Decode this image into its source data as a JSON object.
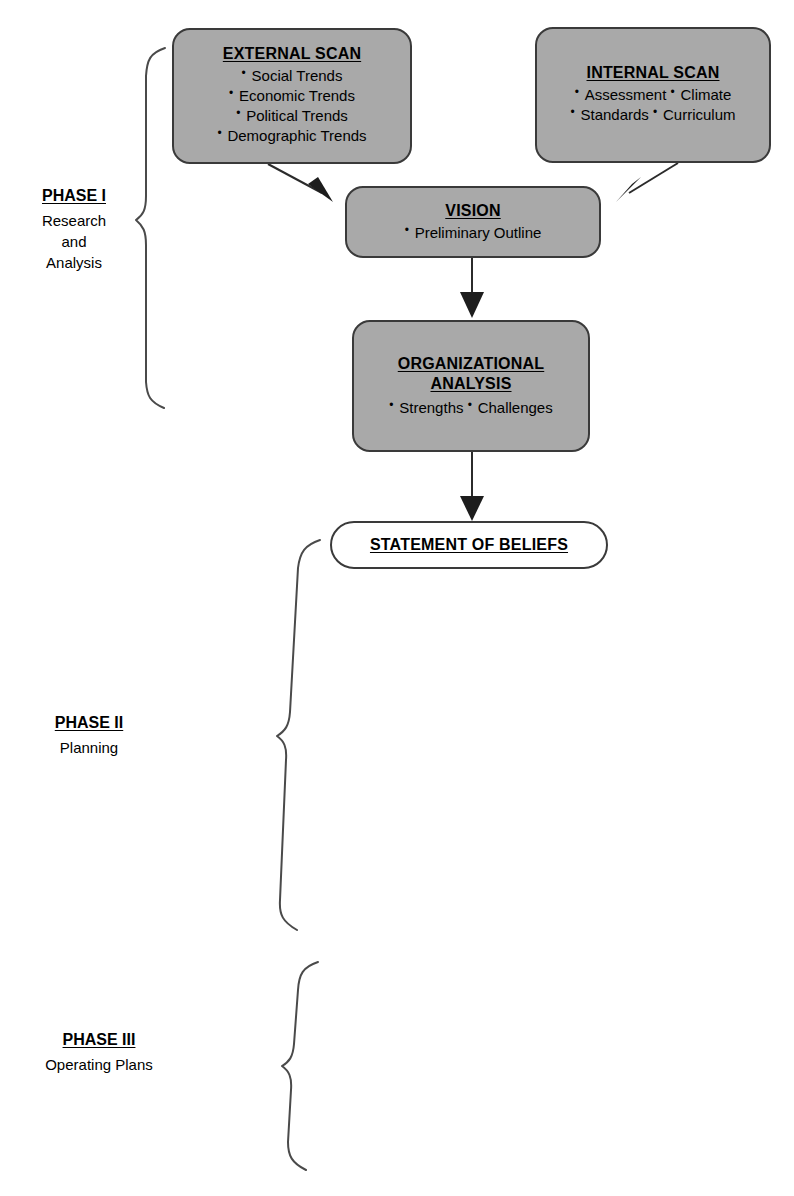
{
  "diagram": {
    "colors": {
      "box_fill_gray": "#a9a9a9",
      "box_fill_white": "#ffffff",
      "stroke": "#3a3a3a",
      "text": "#000000"
    },
    "nodes": {
      "external_scan": {
        "title": "EXTERNAL SCAN",
        "items": [
          "Social Trends",
          "Economic Trends",
          "Political Trends",
          "Demographic Trends"
        ]
      },
      "internal_scan": {
        "title": "INTERNAL  SCAN",
        "items": [
          "Assessment",
          "Climate",
          "Standards",
          "Curriculum"
        ]
      },
      "vision": {
        "title": "VISION",
        "items": [
          "Preliminary Outline"
        ]
      },
      "organizational_analysis": {
        "title": "ORGANIZATIONAL\nANALYSIS",
        "items": [
          "Strengths",
          "Challenges"
        ]
      },
      "statement_of_beliefs": {
        "title": "STATEMENT OF BELIEFS",
        "items": []
      }
    },
    "phases": [
      {
        "name": "PHASE I",
        "description": "Research\nand\nAnalysis"
      },
      {
        "name": "PHASE II",
        "description": "Planning"
      },
      {
        "name": "PHASE III",
        "description": "Operating  Plans"
      }
    ],
    "connectors": [
      {
        "name": "external-scan-to-vision",
        "type": "arrow",
        "style": "diagonal"
      },
      {
        "name": "internal-scan-to-vision",
        "type": "arrow",
        "style": "diagonal"
      },
      {
        "name": "vision-to-organizational-analysis",
        "type": "arrow",
        "style": "vertical"
      },
      {
        "name": "organizational-analysis-to-statement",
        "type": "arrow",
        "style": "vertical"
      }
    ],
    "braces": [
      {
        "name": "phase-1-brace",
        "orientation": "left"
      },
      {
        "name": "phase-2-brace",
        "orientation": "left"
      },
      {
        "name": "phase-3-brace",
        "orientation": "left"
      }
    ]
  }
}
